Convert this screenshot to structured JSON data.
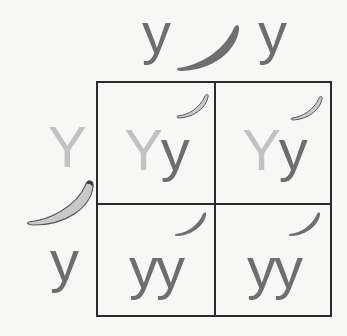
{
  "diagram": {
    "top_alleles": [
      {
        "label": "y",
        "type": "recessive"
      },
      {
        "label": "y",
        "type": "recessive"
      }
    ],
    "top_parent_pod": "green-pod-dark",
    "left_alleles": [
      {
        "label": "Y",
        "type": "dominant"
      },
      {
        "label": "y",
        "type": "recessive"
      }
    ],
    "left_parent_pod": "yellow-pod-light",
    "cells": [
      {
        "row": 0,
        "col": 0,
        "first": "Y",
        "second": "y",
        "pod": "light"
      },
      {
        "row": 0,
        "col": 1,
        "first": "Y",
        "second": "y",
        "pod": "light"
      },
      {
        "row": 1,
        "col": 0,
        "first": "y",
        "second": "y",
        "pod": "dark"
      },
      {
        "row": 1,
        "col": 1,
        "first": "y",
        "second": "y",
        "pod": "dark"
      }
    ],
    "colors": {
      "dominant": "#c2c2c2",
      "recessive": "#6e6e6e",
      "grid": "#2b2b2b",
      "pod_dark": "#6f6f6f",
      "pod_light": "#c9c9c9"
    }
  }
}
